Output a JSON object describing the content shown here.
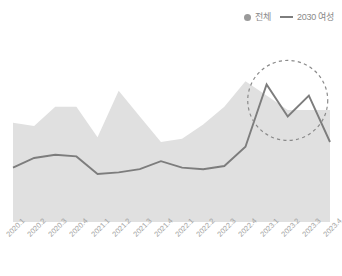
{
  "legend": {
    "position": "top-right",
    "items": [
      {
        "label": "전체",
        "marker": "dot-icon",
        "color": "#9a9a9a"
      },
      {
        "label": "2030 여성",
        "marker": "line-icon",
        "color": "#7d7d7d"
      }
    ]
  },
  "annotation": {
    "type": "dashed-circle",
    "label": "",
    "color": "#8a8a8a"
  },
  "chart_data": {
    "type": "area",
    "title": "",
    "subtitle": "",
    "xlabel": "",
    "ylabel": "",
    "grid": false,
    "legend_position": "top-right",
    "categories": [
      "2020.1",
      "2020.2",
      "2020.3",
      "2020.4",
      "2021.1",
      "2021.2",
      "2021.3",
      "2021.4",
      "2022.1",
      "2022.2",
      "2022.3",
      "2022.4",
      "2023.1",
      "2023.2",
      "2023.3",
      "2023.4"
    ],
    "ylim": [
      0,
      100
    ],
    "series": [
      {
        "name": "전체",
        "type": "area",
        "color": "#e0e0e0",
        "values": [
          62,
          60,
          72,
          72,
          53,
          82,
          66,
          50,
          52,
          61,
          72,
          88,
          79,
          70,
          70,
          70
        ]
      },
      {
        "name": "2030 여성",
        "type": "line",
        "color": "#7d7d7d",
        "values": [
          34,
          40,
          42,
          41,
          30,
          31,
          33,
          38,
          34,
          33,
          35,
          47,
          86,
          66,
          79,
          50
        ]
      }
    ],
    "annotations": [
      {
        "kind": "dashed-circle",
        "target_series": "2030 여성",
        "from_category": "2023.1",
        "to_category": "2023.3",
        "note": "급등 구간 강조"
      }
    ]
  }
}
